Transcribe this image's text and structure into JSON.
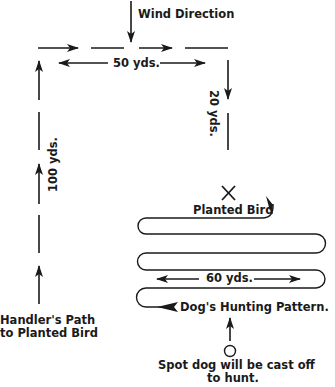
{
  "diagram": {
    "type": "field-training-layout",
    "colors": {
      "ink": "#1a1a1a",
      "background": "#ffffff"
    },
    "labels": {
      "wind_direction": "Wind Direction",
      "distance_top": "50 yds.",
      "distance_right": "20 yds.",
      "distance_left": "100 yds.",
      "planted_bird": "Planted Bird",
      "distance_pattern": "60 yds.",
      "hunting_pattern": "Dog's Hunting Pattern.",
      "handler_path_line1": "Handler's Path",
      "handler_path_line2": "to Planted Bird",
      "cast_off_line1": "Spot dog will be cast off",
      "cast_off_line2": "to hunt."
    },
    "elements": [
      {
        "id": "wind-arrow",
        "kind": "arrow",
        "direction": "down"
      },
      {
        "id": "handler-path",
        "kind": "dashed-arrow-path",
        "segments": [
          "up 100 yds",
          "right 50 yds",
          "down 20 yds"
        ]
      },
      {
        "id": "planted-bird-marker",
        "kind": "x-mark"
      },
      {
        "id": "hunting-pattern",
        "kind": "serpentine-path",
        "passes": 5,
        "width": "60 yds"
      },
      {
        "id": "cast-off-spot",
        "kind": "circle"
      }
    ]
  }
}
